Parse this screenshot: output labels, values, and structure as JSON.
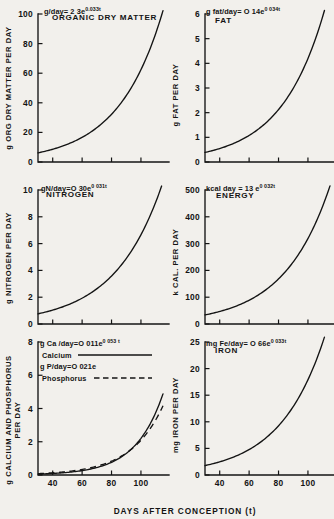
{
  "figure": {
    "xlabel": "DAYS AFTER CONCEPTION (t)",
    "background": "#f2f0ec",
    "ink": "#141414"
  },
  "panels": [
    {
      "key": "organic_dry_matter",
      "name": "ORGANIC DRY MATTER",
      "equation_text": "g/day= 2 3e",
      "equation_exponent": "0.033t",
      "ylabel_line1": "g ORG DRY MATTER PER DAY",
      "yticks": [
        "0",
        "20",
        "40",
        "60",
        "80",
        "100"
      ]
    },
    {
      "key": "fat",
      "name": "FAT",
      "equation_text": "g fat/day= O  14e",
      "equation_exponent": "0 034t",
      "ylabel_line1": "g FAT PER DAY",
      "yticks": [
        "0",
        "1",
        "2",
        "3",
        "4",
        "5",
        "6"
      ]
    },
    {
      "key": "nitrogen",
      "name": "NITROGEN",
      "equation_text": "gN/day=O  30e",
      "equation_exponent": "0 031t",
      "ylabel_line1": "g NITROGEN PER DAY",
      "yticks": [
        "0",
        "2",
        "4",
        "6",
        "8",
        "10"
      ]
    },
    {
      "key": "energy",
      "name": "ENERGY",
      "equation_text": "kcal  day = 13 e",
      "equation_exponent": "0 032t",
      "ylabel_line1": "k CAL. PER DAY",
      "yticks": [
        "0",
        "100",
        "200",
        "300",
        "400",
        "500"
      ]
    },
    {
      "key": "calcium_phosphorus",
      "name": "",
      "equation_text": "g Ca /day=O  011e",
      "equation_exponent": "0 053 t",
      "equation2_text": "g P/day=O  021e",
      "equation2_exponent": "",
      "legend": [
        {
          "label": "Calcium",
          "style": "solid"
        },
        {
          "label": "Phosphorus",
          "style": "dashed"
        }
      ],
      "ylabel_line1": "g CALCIUM AND PHOSPHORUS",
      "ylabel_line2": "PER DAY",
      "yticks": [
        "0",
        "2",
        "4",
        "6",
        "8"
      ]
    },
    {
      "key": "iron",
      "name": "IRON",
      "equation_text": "mg Fe/day= O  66e",
      "equation_exponent": "0 033t",
      "ylabel_line1": "mg IRON PER DAY",
      "yticks": [
        "0",
        "5",
        "10",
        "15",
        "20",
        "25"
      ]
    }
  ],
  "chart_data": {
    "type": "line",
    "title": "",
    "xlabel": "DAYS AFTER CONCEPTION (t)",
    "xticks": [
      40,
      60,
      80,
      100
    ],
    "xlim": [
      30,
      115
    ],
    "subplots": [
      {
        "name": "ORGANIC DRY MATTER",
        "ylabel": "g ORG DRY MATTER PER DAY",
        "ylim": [
          0,
          100
        ],
        "yticks": [
          0,
          20,
          40,
          60,
          80,
          100
        ],
        "equation": "g/day = 2.3e^(0.033t)",
        "coefficient": 2.3,
        "rate": 0.033,
        "series": [
          {
            "name": "organic dry matter",
            "style": "solid",
            "x": [
              30,
              40,
              50,
              60,
              70,
              80,
              90,
              100,
              110,
              115
            ],
            "values": [
              6.2,
              8.6,
              12.0,
              16.6,
              23.1,
              32.1,
              44.7,
              62.1,
              86.3,
              101.8
            ]
          }
        ]
      },
      {
        "name": "FAT",
        "ylabel": "g FAT PER DAY",
        "ylim": [
          0,
          6
        ],
        "yticks": [
          0,
          1,
          2,
          3,
          4,
          5,
          6
        ],
        "equation": "g fat/day = 0.14e^(0.034t)",
        "coefficient": 0.14,
        "rate": 0.034,
        "series": [
          {
            "name": "fat",
            "style": "solid",
            "x": [
              30,
              40,
              50,
              60,
              70,
              80,
              90,
              100,
              110,
              115
            ],
            "values": [
              0.39,
              0.54,
              0.76,
              1.07,
              1.51,
              2.12,
              2.98,
              4.19,
              5.89,
              6.98
            ]
          }
        ]
      },
      {
        "name": "NITROGEN",
        "ylabel": "g NITROGEN PER DAY",
        "ylim": [
          0,
          10
        ],
        "yticks": [
          0,
          2,
          4,
          6,
          8,
          10
        ],
        "equation": "g N/day = 0.30e^(0.031t)",
        "coefficient": 0.3,
        "rate": 0.031,
        "series": [
          {
            "name": "nitrogen",
            "style": "solid",
            "x": [
              30,
              40,
              50,
              60,
              70,
              80,
              90,
              100,
              110,
              115
            ],
            "values": [
              0.76,
              1.04,
              1.42,
              1.93,
              2.63,
              3.59,
              4.89,
              6.67,
              9.09,
              10.61
            ]
          }
        ]
      },
      {
        "name": "ENERGY",
        "ylabel": "k CAL. PER DAY",
        "ylim": [
          0,
          500
        ],
        "yticks": [
          0,
          100,
          200,
          300,
          400,
          500
        ],
        "equation": "kcal/day = 13e^(0.032t)",
        "coefficient": 13,
        "rate": 0.032,
        "series": [
          {
            "name": "energy",
            "style": "solid",
            "x": [
              30,
              40,
              50,
              60,
              70,
              80,
              90,
              100,
              110,
              115
            ],
            "values": [
              34,
              47,
              64,
              88,
              122,
              168,
              231,
              318,
              438,
              514
            ]
          }
        ]
      },
      {
        "name": "CALCIUM AND PHOSPHORUS",
        "ylabel": "g CALCIUM AND PHOSPHORUS PER DAY",
        "ylim": [
          0,
          8
        ],
        "yticks": [
          0,
          2,
          4,
          6,
          8
        ],
        "equation": "g Ca/day = 0.011e^(0.053t)",
        "equation2": "g P/day = 0.021e",
        "series": [
          {
            "name": "Calcium",
            "style": "solid",
            "coefficient": 0.011,
            "rate": 0.053,
            "x": [
              30,
              40,
              50,
              60,
              70,
              80,
              90,
              100,
              110,
              113
            ],
            "values": [
              0.054,
              0.092,
              0.156,
              0.265,
              0.45,
              0.764,
              1.297,
              2.202,
              3.739,
              4.382
            ]
          },
          {
            "name": "Phosphorus",
            "style": "dashed",
            "coefficient": 0.021,
            "rate": 0.046,
            "x": [
              30,
              40,
              50,
              60,
              70,
              80,
              90,
              100,
              110,
              113
            ],
            "values": [
              0.084,
              0.133,
              0.21,
              0.333,
              0.528,
              0.836,
              1.324,
              2.097,
              3.321,
              3.812
            ]
          }
        ]
      },
      {
        "name": "IRON",
        "ylabel": "mg IRON PER DAY",
        "ylim": [
          0,
          25
        ],
        "yticks": [
          0,
          5,
          10,
          15,
          20,
          25
        ],
        "equation": "mg Fe/day = 0.66e^(0.033t)",
        "coefficient": 0.66,
        "rate": 0.033,
        "series": [
          {
            "name": "iron",
            "style": "solid",
            "x": [
              30,
              40,
              50,
              60,
              70,
              80,
              90,
              100,
              110,
              115
            ],
            "values": [
              1.78,
              2.47,
              3.44,
              4.78,
              6.65,
              9.24,
              12.85,
              17.86,
              24.84,
              29.3
            ]
          }
        ]
      }
    ]
  }
}
